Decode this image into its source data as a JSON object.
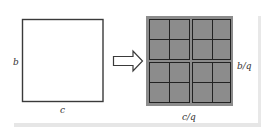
{
  "diagram": {
    "left_square": {
      "height_label": "b",
      "width_label": "c"
    },
    "arrow": {
      "direction": "right",
      "style": "hollow"
    },
    "grid": {
      "rows": 4,
      "cols": 4,
      "block_groups": "2x2 blocks of 2x2 cells",
      "cell_height_label": "b/q",
      "cell_width_label": "c/q",
      "fill_color": "#8c8c8c",
      "line_color": "#222222"
    },
    "frame_color": "#e6e6e6"
  }
}
